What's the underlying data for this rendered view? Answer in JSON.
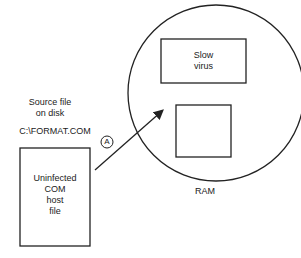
{
  "diagram": {
    "source_label_line1": "Source file",
    "source_label_line2": "on disk",
    "filename": "C:\\FORMAT.COM",
    "host_file": [
      "Uninfected",
      "COM",
      "host",
      "file"
    ],
    "virus_box": [
      "Slow",
      "virus"
    ],
    "ram_label": "RAM",
    "step_marker": "A"
  }
}
